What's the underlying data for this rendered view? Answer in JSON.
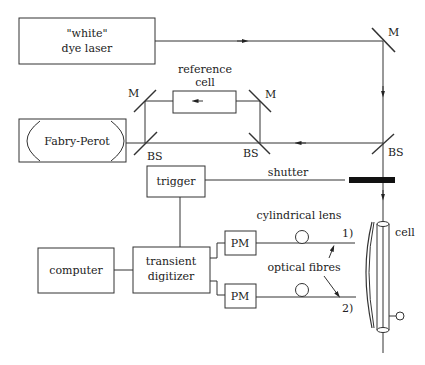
{
  "diagram": {
    "components": {
      "laser": {
        "line1": "\"white\"",
        "line2": "dye laser"
      },
      "reference_cell": {
        "line1": "reference",
        "line2": "cell"
      },
      "fabry_perot": {
        "label": "Fabry-Perot"
      },
      "trigger": {
        "label": "trigger"
      },
      "shutter": {
        "label": "shutter"
      },
      "computer": {
        "label": "computer"
      },
      "digitizer": {
        "line1": "transient",
        "line2": "digitizer"
      },
      "pm1": {
        "label": "PM"
      },
      "pm2": {
        "label": "PM"
      },
      "cylindrical_lens": {
        "label": "cylindrical lens"
      },
      "optical_fibres": {
        "label": "optical fibres"
      },
      "fibre1": {
        "label": "1)"
      },
      "fibre2": {
        "label": "2)"
      },
      "cell": {
        "label": "cell"
      }
    },
    "mirrors": [
      {
        "id": "m-top-right",
        "label": "M"
      },
      {
        "id": "m-ref-left",
        "label": "M"
      },
      {
        "id": "m-ref-right",
        "label": "M"
      }
    ],
    "beamsplitters": [
      {
        "id": "bs-left",
        "label": "BS"
      },
      {
        "id": "bs-mid",
        "label": "BS"
      },
      {
        "id": "bs-right",
        "label": "BS"
      }
    ]
  }
}
